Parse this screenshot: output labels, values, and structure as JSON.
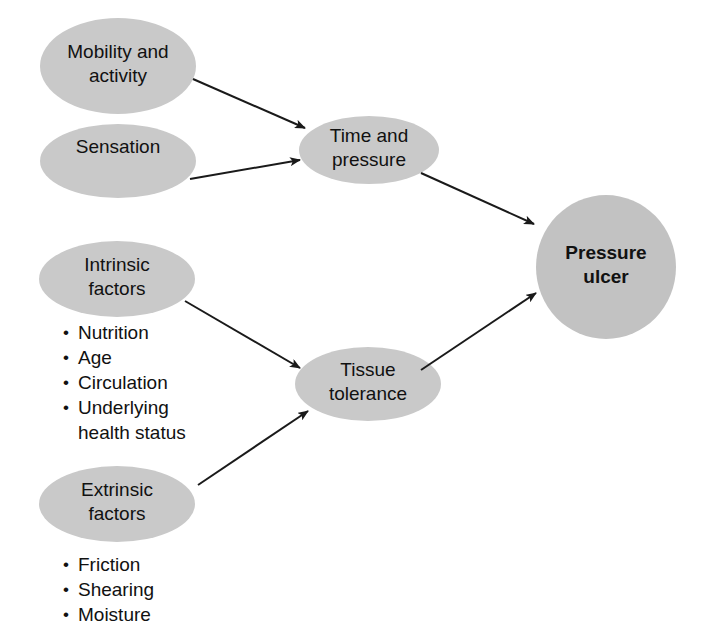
{
  "diagram": {
    "background_color": "#ffffff",
    "node_fill_color": "#c9c9c9",
    "outcome_fill_color": "#c2c2c2",
    "line_color": "#1a1a1a",
    "text_color": "#111111",
    "nodes": [
      {
        "id": "mobility-activity",
        "label": "Mobility and\nactivity",
        "shape": "ellipse",
        "cx": 118,
        "cy": 66,
        "rx": 78,
        "ry": 48,
        "bold": false
      },
      {
        "id": "sensation",
        "label": "Sensation",
        "shape": "ellipse",
        "cx": 118,
        "cy": 161,
        "rx": 78,
        "ry": 37,
        "bold": false
      },
      {
        "id": "time-and-pressure",
        "label": "Time and\npressure",
        "shape": "ellipse",
        "cx": 369,
        "cy": 150,
        "rx": 70,
        "ry": 34,
        "bold": false
      },
      {
        "id": "intrinsic-factors",
        "label": "Intrinsic\nfactors",
        "shape": "ellipse",
        "cx": 117,
        "cy": 279,
        "rx": 78,
        "ry": 38,
        "bold": false
      },
      {
        "id": "extrinsic-factors",
        "label": "Extrinsic\nfactors",
        "shape": "ellipse",
        "cx": 117,
        "cy": 504,
        "rx": 78,
        "ry": 38,
        "bold": false
      },
      {
        "id": "tissue-tolerance",
        "label": "Tissue\ntolerance",
        "shape": "ellipse",
        "cx": 368,
        "cy": 384,
        "rx": 73,
        "ry": 37,
        "bold": false
      },
      {
        "id": "pressure-ulcer",
        "label": "Pressure\nulcer",
        "shape": "ellipse",
        "cx": 606,
        "cy": 267,
        "rx": 70,
        "ry": 72,
        "bold": true
      }
    ],
    "edges": [
      {
        "id": "mobility-to-time",
        "from": "mobility-activity",
        "to": "time-and-pressure",
        "x1": 193,
        "y1": 79,
        "x2": 305,
        "y2": 128
      },
      {
        "id": "sensation-to-time",
        "from": "sensation",
        "to": "time-and-pressure",
        "x1": 190,
        "y1": 179,
        "x2": 300,
        "y2": 160
      },
      {
        "id": "time-to-ulcer",
        "from": "time-and-pressure",
        "to": "pressure-ulcer",
        "x1": 421,
        "y1": 173,
        "x2": 534,
        "y2": 224
      },
      {
        "id": "intrinsic-to-tissue",
        "from": "intrinsic-factors",
        "to": "tissue-tolerance",
        "x1": 185,
        "y1": 301,
        "x2": 300,
        "y2": 368
      },
      {
        "id": "extrinsic-to-tissue",
        "from": "extrinsic-factors",
        "to": "tissue-tolerance",
        "x1": 198,
        "y1": 485,
        "x2": 308,
        "y2": 411
      },
      {
        "id": "tissue-to-ulcer",
        "from": "tissue-tolerance",
        "to": "pressure-ulcer",
        "x1": 421,
        "y1": 370,
        "x2": 536,
        "y2": 293
      }
    ],
    "bullet_groups": [
      {
        "id": "intrinsic-factors-bullets",
        "for_node": "intrinsic-factors",
        "x": 63,
        "y": 320,
        "items": [
          "Nutrition",
          "Age",
          "Circulation",
          "Underlying\nhealth status"
        ]
      },
      {
        "id": "extrinsic-factors-bullets",
        "for_node": "extrinsic-factors",
        "x": 63,
        "y": 552,
        "items": [
          "Friction",
          "Shearing",
          "Moisture"
        ]
      }
    ]
  }
}
